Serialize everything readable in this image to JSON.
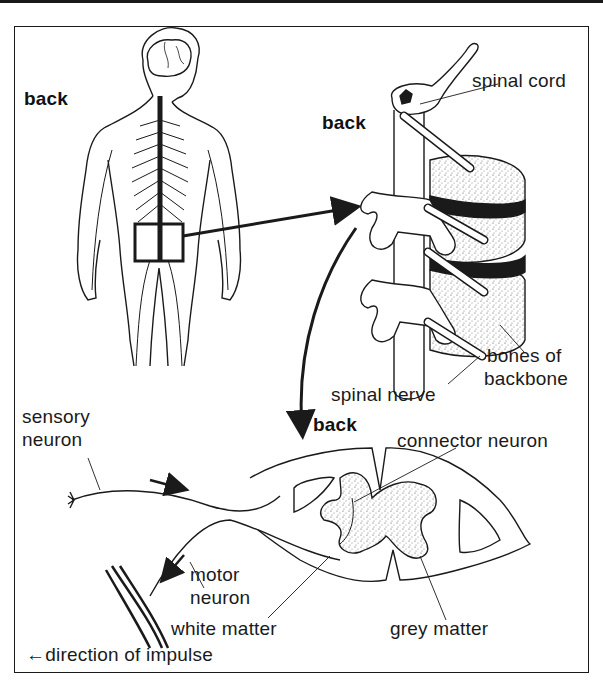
{
  "diagram": {
    "panels": {
      "body": {
        "orientation_label": "back"
      },
      "vertebrae": {
        "orientation_label": "back",
        "labels": {
          "spinal_cord": "spinal cord",
          "bones_line1": "bones of",
          "bones_line2": "backbone",
          "spinal_nerve": "spinal nerve"
        }
      },
      "cross_section": {
        "orientation_label": "back",
        "labels": {
          "sensory_line1": "sensory",
          "sensory_line2": "neuron",
          "connector": "connector neuron",
          "motor_line1": "motor",
          "motor_line2": "neuron",
          "white_matter": "white matter",
          "grey_matter": "grey matter"
        }
      }
    },
    "legend": {
      "arrow_glyph": "←",
      "text": "direction of impulse"
    },
    "colors": {
      "ink": "#1a1a1a",
      "paper": "#ffffff",
      "stipple": "#555555"
    }
  }
}
